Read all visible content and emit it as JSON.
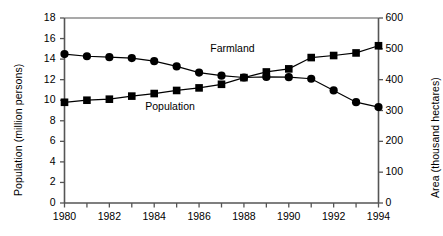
{
  "chart_data": {
    "type": "line",
    "title": "",
    "xlabel": "",
    "ylabel": "Population (million persons)",
    "ylabel_right": "Area (thousand hectares)",
    "x": [
      1980,
      1981,
      1982,
      1983,
      1984,
      1985,
      1986,
      1987,
      1988,
      1989,
      1990,
      1991,
      1992,
      1993,
      1994
    ],
    "xlim": [
      1980,
      1994
    ],
    "xticks": [
      1980,
      1981,
      1982,
      1983,
      1984,
      1985,
      1986,
      1987,
      1988,
      1989,
      1990,
      1991,
      1992,
      1993,
      1994
    ],
    "xtick_labels": [
      "1980",
      "",
      "1982",
      "",
      "1984",
      "",
      "1986",
      "",
      "1988",
      "",
      "1990",
      "",
      "1992",
      "",
      "1994"
    ],
    "ylim": [
      0,
      18
    ],
    "yticks": [
      0,
      2,
      4,
      6,
      8,
      10,
      12,
      14,
      16,
      18
    ],
    "ytick_labels": [
      "0",
      "2",
      "4",
      "6",
      "8",
      "10",
      "12",
      "14",
      "16",
      "18"
    ],
    "ylim_right": [
      0,
      600
    ],
    "yticks_right": [
      0,
      100,
      200,
      300,
      400,
      500,
      600
    ],
    "ytick_labels_right": [
      "0",
      "100",
      "200",
      "300",
      "400",
      "500",
      "600"
    ],
    "grid": false,
    "legend": "inline-annotations",
    "series": [
      {
        "name": "Farmland",
        "axis": "right",
        "unit": "thousand hectares",
        "marker": "circle",
        "color": "#000000",
        "label_position": {
          "x": 1986.5,
          "y": 15.0
        },
        "values": [
          483,
          476,
          473,
          470,
          460,
          443,
          423,
          413,
          407,
          409,
          408,
          403,
          365,
          327,
          311
        ],
        "values_left_axis_equivalent": [
          14.5,
          14.3,
          14.2,
          14.1,
          13.8,
          13.3,
          12.7,
          12.4,
          12.2,
          12.3,
          12.25,
          12.1,
          10.95,
          9.8,
          9.35
        ]
      },
      {
        "name": "Population",
        "axis": "left",
        "unit": "million persons",
        "marker": "square",
        "color": "#000000",
        "label_position": {
          "x": 1983.6,
          "y": 9.3
        },
        "values": [
          9.8,
          10.0,
          10.1,
          10.4,
          10.65,
          10.95,
          11.2,
          11.55,
          12.2,
          12.75,
          13.05,
          14.15,
          14.35,
          14.6,
          15.3
        ],
        "values_right_axis_equivalent": [
          327,
          333,
          337,
          347,
          355,
          365,
          373,
          385,
          407,
          425,
          435,
          472,
          478,
          487,
          510
        ]
      }
    ]
  }
}
